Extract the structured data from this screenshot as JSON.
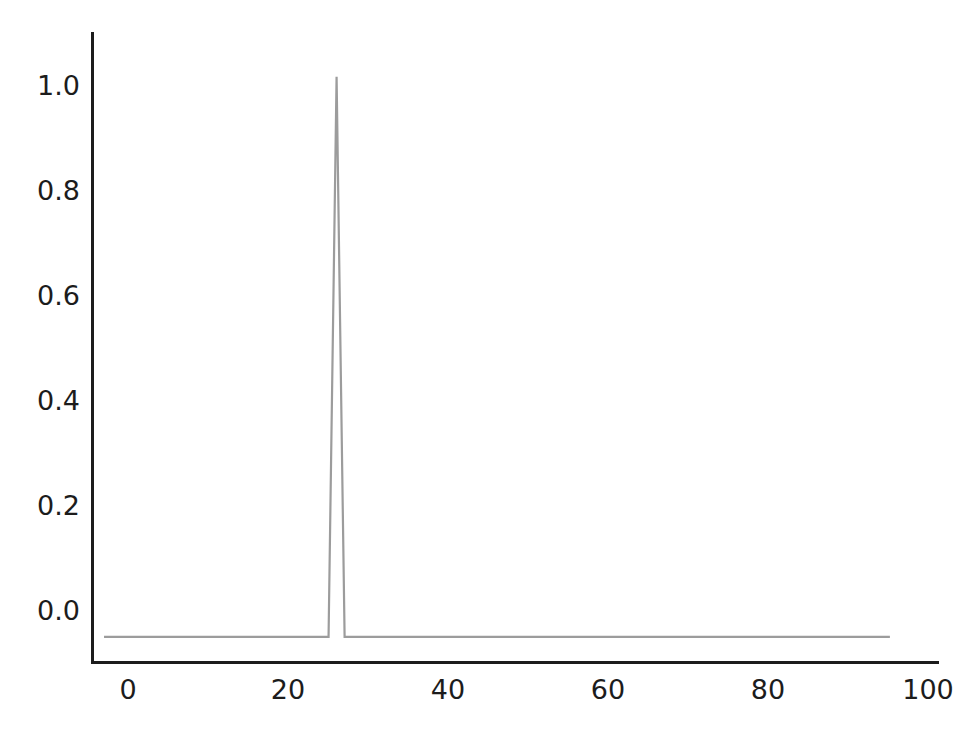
{
  "chart_data": {
    "type": "line",
    "title": "",
    "xlabel": "",
    "ylabel": "",
    "xlim": [
      -1.5,
      104
    ],
    "ylim": [
      -0.045,
      1.08
    ],
    "grid": false,
    "legend": null,
    "line_color": "#9c9c9c",
    "axis_color": "#1c1c1c",
    "background_color": "#ffffff",
    "line_width": 2.2,
    "xticks": [
      0,
      20,
      40,
      60,
      80,
      100
    ],
    "xtick_labels": [
      "0",
      "20",
      "40",
      "60",
      "80",
      "100"
    ],
    "yticks": [
      0.0,
      0.2,
      0.4,
      0.6,
      0.8,
      1.0
    ],
    "ytick_labels": [
      "0.0",
      "0.2",
      "0.4",
      "0.6",
      "0.8",
      "1.0"
    ],
    "series": [
      {
        "name": "impulse",
        "x": [
          0,
          1,
          2,
          3,
          4,
          5,
          6,
          7,
          8,
          9,
          10,
          11,
          12,
          13,
          14,
          15,
          16,
          17,
          18,
          19,
          20,
          21,
          22,
          23,
          24,
          25,
          26,
          27,
          28,
          29,
          30,
          31,
          32,
          33,
          34,
          35,
          36,
          37,
          38,
          39,
          40,
          41,
          42,
          43,
          44,
          45,
          46,
          47,
          48,
          49,
          50,
          51,
          52,
          53,
          54,
          55,
          56,
          57,
          58,
          59,
          60,
          61,
          62,
          63,
          64,
          65,
          66,
          67,
          68,
          69,
          70,
          71,
          72,
          73,
          74,
          75,
          76,
          77,
          78,
          79,
          80,
          81,
          82,
          83,
          84,
          85,
          86,
          87,
          88,
          89,
          90,
          91,
          92,
          93,
          94,
          95,
          96,
          97,
          98
        ],
        "y": [
          0,
          0,
          0,
          0,
          0,
          0,
          0,
          0,
          0,
          0,
          0,
          0,
          0,
          0,
          0,
          0,
          0,
          0,
          0,
          0,
          0,
          0,
          0,
          0,
          0,
          0,
          0,
          0,
          0,
          1.0,
          0,
          0,
          0,
          0,
          0,
          0,
          0,
          0,
          0,
          0,
          0,
          0,
          0,
          0,
          0,
          0,
          0,
          0,
          0,
          0,
          0,
          0,
          0,
          0,
          0,
          0,
          0,
          0,
          0,
          0,
          0,
          0,
          0,
          0,
          0,
          0,
          0,
          0,
          0,
          0,
          0,
          0,
          0,
          0,
          0,
          0,
          0,
          0,
          0,
          0,
          0,
          0,
          0,
          0,
          0,
          0,
          0,
          0,
          0,
          0,
          0,
          0,
          0,
          0,
          0,
          0,
          0,
          0,
          0
        ]
      }
    ],
    "peak": {
      "x": 29,
      "y": 1.0
    },
    "baseline_value": 0.0
  },
  "axes": {
    "x_tick_0": "0",
    "x_tick_1": "20",
    "x_tick_2": "40",
    "x_tick_3": "60",
    "x_tick_4": "80",
    "x_tick_5": "100",
    "y_tick_0": "0.0",
    "y_tick_1": "0.2",
    "y_tick_2": "0.4",
    "y_tick_3": "0.6",
    "y_tick_4": "0.8",
    "y_tick_5": "1.0"
  }
}
